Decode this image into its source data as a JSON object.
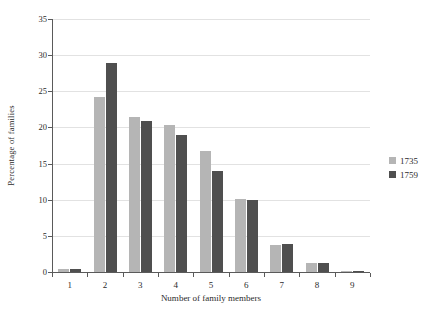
{
  "chart_data": {
    "type": "bar",
    "title": "",
    "subtitle": "",
    "xlabel": "Number of family members",
    "ylabel": "Percentage of families",
    "categories": [
      "1",
      "2",
      "3",
      "4",
      "5",
      "6",
      "7",
      "8",
      "9"
    ],
    "series": [
      {
        "name": "1735",
        "color": "#b5b5b5",
        "values": [
          0.4,
          24.2,
          21.4,
          20.3,
          16.8,
          10.1,
          3.7,
          1.2,
          0.1
        ]
      },
      {
        "name": "1759",
        "color": "#4f4f4f",
        "values": [
          0.4,
          28.9,
          20.9,
          18.9,
          14.0,
          10.0,
          3.9,
          1.2,
          0.1
        ]
      }
    ],
    "ylim": [
      0,
      35
    ],
    "yticks": [
      0,
      5,
      10,
      15,
      20,
      25,
      30,
      35
    ],
    "ytick_labels": [
      "0",
      "5",
      "10",
      "15",
      "20",
      "25",
      "30",
      "35"
    ],
    "grid": true,
    "grid_axis": "y",
    "legend_position": "right",
    "legend_entries": [
      "1735",
      "1759"
    ],
    "background_color": "#ffffff",
    "axis_color": "#5a5a5a",
    "grid_color": "#e2e2e2"
  }
}
